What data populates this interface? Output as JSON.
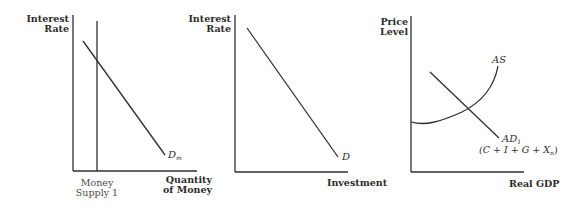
{
  "panels": [
    {
      "id": "money-market",
      "y_label_line1": "Interest",
      "y_label_line2": "Rate",
      "x_label_line1": "Quantity",
      "x_label_line2": "of Money",
      "curve_label": "D",
      "curve_label_sub": "m",
      "supply_label_line1": "Money",
      "supply_label_line2": "Supply 1"
    },
    {
      "id": "investment-demand",
      "y_label_line1": "Interest",
      "y_label_line2": "Rate",
      "x_label": "Investment",
      "curve_label": "D"
    },
    {
      "id": "ad-as",
      "y_label_line1": "Price",
      "y_label_line2": "Level",
      "x_label": "Real GDP",
      "as_label": "AS",
      "ad_label": "AD",
      "ad_label_sub": "1",
      "ad_formula": "(C + I + G + X",
      "ad_formula_sub": "n",
      "ad_formula_close": ")"
    }
  ],
  "colors": {
    "line": "#2f2f2f",
    "text": "#2b2b2b",
    "background": "#ffffff"
  }
}
